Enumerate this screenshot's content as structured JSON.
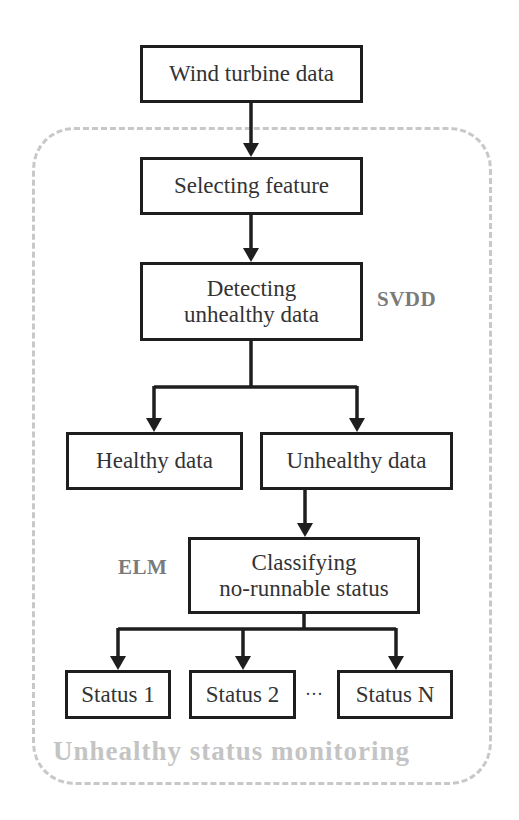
{
  "diagram": {
    "group": {
      "label": "Unhealthy status monitoring",
      "border_color": "#c8c8c8",
      "style": "dashed-rounded"
    },
    "nodes": {
      "input": "Wind turbine data",
      "select": "Selecting feature",
      "detect_line1": "Detecting",
      "detect_line2": "unhealthy data",
      "healthy": "Healthy data",
      "unhealthy": "Unhealthy data",
      "classify_line1": "Classifying",
      "classify_line2": "no-runnable status",
      "status1": "Status 1",
      "status2": "Status 2",
      "statusN": "Status N",
      "ellipsis": "···"
    },
    "annotations": {
      "svdd": "SVDD",
      "elm": "ELM"
    },
    "edges": [
      [
        "Wind turbine data",
        "Selecting feature"
      ],
      [
        "Selecting feature",
        "Detecting unhealthy data"
      ],
      [
        "Detecting unhealthy data",
        "Healthy data"
      ],
      [
        "Detecting unhealthy data",
        "Unhealthy data"
      ],
      [
        "Unhealthy data",
        "Classifying no-runnable status"
      ],
      [
        "Classifying no-runnable status",
        "Status 1"
      ],
      [
        "Classifying no-runnable status",
        "Status 2"
      ],
      [
        "Classifying no-runnable status",
        "Status N"
      ]
    ],
    "colors": {
      "box_border": "#1e1e1e",
      "text": "#333333",
      "annotation": "#7a7a7a",
      "group_label": "#c4c4c4"
    }
  }
}
